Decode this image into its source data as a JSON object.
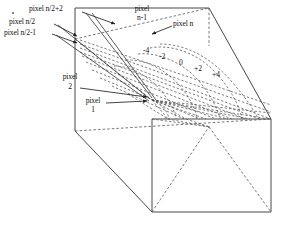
{
  "figure": {
    "type": "3d-perspective-wireframe-diagram",
    "colors": {
      "line": "#333333",
      "dashed": "#555555",
      "text": "#111111",
      "background": "#ffffff"
    }
  },
  "labels": {
    "pixel_n_half_plus2": "pixel n/2+2",
    "pixel_n_half": "pixel n/2",
    "pixel_n_half_minus1": "pixel n/2-1",
    "pixel_n_minus1_line1": "pixel",
    "pixel_n_minus1_line2": "n-1",
    "pixel_n": "pixel n",
    "pixel_2_line1": "pixel",
    "pixel_2_line2": "2",
    "pixel_1_line1": "pixel",
    "pixel_1_line2": "1"
  },
  "scale_marks": {
    "values": [
      "-4",
      "-2",
      "0",
      "+2",
      "+4"
    ]
  }
}
